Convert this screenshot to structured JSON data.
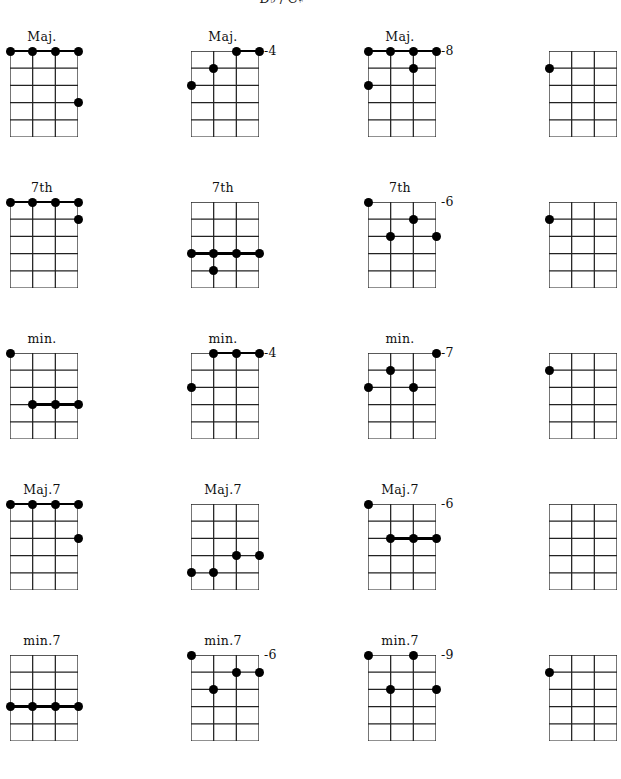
{
  "page": {
    "title_root": "D",
    "title_accidental_flat": "♭",
    "title_separator": "/",
    "title_alt_root": "C",
    "title_accidental_sharp": "♯",
    "title_full": "D♭ / C♯",
    "background_color": "#ffffff",
    "ink_color": "#000000",
    "grid_line_color": "#222222"
  },
  "diagram_spec": {
    "strings": 4,
    "fret_spaces": 5,
    "fret_lines": 6,
    "dot_shape": "filled-circle",
    "note": "dot.s = string index 0..3 left-to-right; dot.f = fret-line index 0..5 top-to-bottom"
  },
  "rows": [
    {
      "label": "Maj.",
      "cells": [
        {
          "name": "Maj.",
          "position": "",
          "dots": [
            {
              "s": 0,
              "f": 0
            },
            {
              "s": 1,
              "f": 0
            },
            {
              "s": 2,
              "f": 0
            },
            {
              "s": 3,
              "f": 0
            },
            {
              "s": 3,
              "f": 3
            }
          ],
          "barres": [
            {
              "f": 0,
              "from": 0,
              "to": 3
            }
          ]
        },
        {
          "name": "Maj.",
          "position": "-4",
          "dots": [
            {
              "s": 2,
              "f": 0
            },
            {
              "s": 3,
              "f": 0
            },
            {
              "s": 1,
              "f": 1
            },
            {
              "s": 0,
              "f": 2
            }
          ],
          "barres": [
            {
              "f": 0,
              "from": 2,
              "to": 3
            }
          ]
        },
        {
          "name": "Maj.",
          "position": "-8",
          "dots": [
            {
              "s": 0,
              "f": 0
            },
            {
              "s": 1,
              "f": 0
            },
            {
              "s": 2,
              "f": 0
            },
            {
              "s": 3,
              "f": 0
            },
            {
              "s": 2,
              "f": 1
            },
            {
              "s": 0,
              "f": 2
            }
          ],
          "barres": [
            {
              "f": 0,
              "from": 0,
              "to": 3
            }
          ]
        },
        {
          "name": "",
          "position": "",
          "dots": [
            {
              "s": 0,
              "f": 1
            }
          ],
          "barres": []
        }
      ]
    },
    {
      "label": "7th",
      "cells": [
        {
          "name": "7th",
          "position": "",
          "dots": [
            {
              "s": 0,
              "f": 0
            },
            {
              "s": 1,
              "f": 0
            },
            {
              "s": 2,
              "f": 0
            },
            {
              "s": 3,
              "f": 0
            },
            {
              "s": 3,
              "f": 1
            }
          ],
          "barres": [
            {
              "f": 0,
              "from": 0,
              "to": 3
            }
          ]
        },
        {
          "name": "7th",
          "position": "",
          "dots": [
            {
              "s": 0,
              "f": 3
            },
            {
              "s": 1,
              "f": 3
            },
            {
              "s": 2,
              "f": 3
            },
            {
              "s": 3,
              "f": 3
            },
            {
              "s": 1,
              "f": 4
            }
          ],
          "barres": [
            {
              "f": 3,
              "from": 0,
              "to": 3
            }
          ]
        },
        {
          "name": "7th",
          "position": "-6",
          "dots": [
            {
              "s": 0,
              "f": 0
            },
            {
              "s": 2,
              "f": 1
            },
            {
              "s": 1,
              "f": 2
            },
            {
              "s": 3,
              "f": 2
            }
          ],
          "barres": []
        },
        {
          "name": "",
          "position": "",
          "dots": [
            {
              "s": 0,
              "f": 1
            }
          ],
          "barres": []
        }
      ]
    },
    {
      "label": "min.",
      "cells": [
        {
          "name": "min.",
          "position": "",
          "dots": [
            {
              "s": 0,
              "f": 0
            },
            {
              "s": 1,
              "f": 3
            },
            {
              "s": 2,
              "f": 3
            },
            {
              "s": 3,
              "f": 3
            }
          ],
          "barres": [
            {
              "f": 3,
              "from": 1,
              "to": 3
            }
          ]
        },
        {
          "name": "min.",
          "position": "-4",
          "dots": [
            {
              "s": 1,
              "f": 0
            },
            {
              "s": 2,
              "f": 0
            },
            {
              "s": 3,
              "f": 0
            },
            {
              "s": 0,
              "f": 2
            }
          ],
          "barres": [
            {
              "f": 0,
              "from": 1,
              "to": 3
            }
          ]
        },
        {
          "name": "min.",
          "position": "-7",
          "dots": [
            {
              "s": 3,
              "f": 0
            },
            {
              "s": 1,
              "f": 1
            },
            {
              "s": 0,
              "f": 2
            },
            {
              "s": 2,
              "f": 2
            }
          ],
          "barres": []
        },
        {
          "name": "",
          "position": "",
          "dots": [
            {
              "s": 0,
              "f": 1
            }
          ],
          "barres": []
        }
      ]
    },
    {
      "label": "Maj.7",
      "cells": [
        {
          "name": "Maj.7",
          "position": "",
          "dots": [
            {
              "s": 0,
              "f": 0
            },
            {
              "s": 1,
              "f": 0
            },
            {
              "s": 2,
              "f": 0
            },
            {
              "s": 3,
              "f": 0
            },
            {
              "s": 3,
              "f": 2
            }
          ],
          "barres": [
            {
              "f": 0,
              "from": 0,
              "to": 3
            }
          ]
        },
        {
          "name": "Maj.7",
          "position": "",
          "dots": [
            {
              "s": 2,
              "f": 3
            },
            {
              "s": 3,
              "f": 3
            },
            {
              "s": 0,
              "f": 4
            },
            {
              "s": 1,
              "f": 4
            }
          ],
          "barres": []
        },
        {
          "name": "Maj.7",
          "position": "-6",
          "dots": [
            {
              "s": 0,
              "f": 0
            },
            {
              "s": 1,
              "f": 2
            },
            {
              "s": 2,
              "f": 2
            },
            {
              "s": 3,
              "f": 2
            }
          ],
          "barres": [
            {
              "f": 2,
              "from": 1,
              "to": 3
            }
          ]
        },
        {
          "name": "",
          "position": "",
          "dots": [],
          "barres": []
        }
      ]
    },
    {
      "label": "min.7",
      "cells": [
        {
          "name": "min.7",
          "position": "",
          "dots": [
            {
              "s": 0,
              "f": 3
            },
            {
              "s": 1,
              "f": 3
            },
            {
              "s": 2,
              "f": 3
            },
            {
              "s": 3,
              "f": 3
            }
          ],
          "barres": [
            {
              "f": 3,
              "from": 0,
              "to": 3
            }
          ]
        },
        {
          "name": "min.7",
          "position": "-6",
          "dots": [
            {
              "s": 0,
              "f": 0
            },
            {
              "s": 2,
              "f": 1
            },
            {
              "s": 3,
              "f": 1
            },
            {
              "s": 1,
              "f": 2
            }
          ],
          "barres": []
        },
        {
          "name": "min.7",
          "position": "-9",
          "dots": [
            {
              "s": 0,
              "f": 0
            },
            {
              "s": 2,
              "f": 0
            },
            {
              "s": 1,
              "f": 2
            },
            {
              "s": 3,
              "f": 2
            }
          ],
          "barres": []
        },
        {
          "name": "",
          "position": "",
          "dots": [
            {
              "s": 0,
              "f": 1
            }
          ],
          "barres": []
        }
      ]
    }
  ]
}
